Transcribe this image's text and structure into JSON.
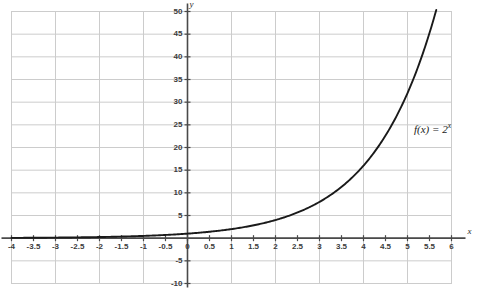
{
  "chart_data": {
    "type": "line",
    "title": "",
    "xlabel": "x",
    "ylabel": "y",
    "annotation": "f(x) = 2^x",
    "annotation_base": "f(x) = 2",
    "annotation_exponent": "x",
    "function": "f(x) = 2^x",
    "grid": true,
    "legend_position": "none",
    "xlim": [
      -4,
      6
    ],
    "ylim": [
      -10,
      50
    ],
    "x_ticks": [
      "-4",
      "-3.5",
      "-3",
      "-2.5",
      "-2",
      "-1.5",
      "-1",
      "-0.5",
      "0",
      "0.5",
      "1",
      "1.5",
      "2",
      "2.5",
      "3",
      "3.5",
      "4",
      "4.5",
      "5",
      "5.5",
      "6"
    ],
    "x_tick_values": [
      -4,
      -3.5,
      -3,
      -2.5,
      -2,
      -1.5,
      -1,
      -0.5,
      0,
      0.5,
      1,
      1.5,
      2,
      2.5,
      3,
      3.5,
      4,
      4.5,
      5,
      5.5,
      6
    ],
    "y_ticks": [
      "-10",
      "-5",
      "5",
      "10",
      "15",
      "20",
      "25",
      "30",
      "35",
      "40",
      "45",
      "50"
    ],
    "y_tick_values": [
      -10,
      -5,
      5,
      10,
      15,
      20,
      25,
      30,
      35,
      40,
      45,
      50
    ],
    "x_gridline_step": 1,
    "y_gridline_step": 5,
    "x": [
      -4,
      -3.5,
      -3,
      -2.5,
      -2,
      -1.5,
      -1,
      -0.5,
      0,
      0.5,
      1,
      1.5,
      2,
      2.5,
      3,
      3.5,
      4,
      4.5,
      5,
      5.5,
      5.65
    ],
    "values": [
      0.063,
      0.088,
      0.125,
      0.177,
      0.25,
      0.354,
      0.5,
      0.707,
      1,
      1.414,
      2,
      2.828,
      4,
      5.657,
      8,
      11.314,
      16,
      22.627,
      32,
      45.255,
      50.2
    ],
    "series": [
      {
        "name": "f(x) = 2^x",
        "values": [
          0.063,
          0.088,
          0.125,
          0.177,
          0.25,
          0.354,
          0.5,
          0.707,
          1,
          1.414,
          2,
          2.828,
          4,
          5.657,
          8,
          11.314,
          16,
          22.627,
          32,
          45.255,
          50.2
        ]
      }
    ]
  },
  "colors": {
    "background": "#ffffff",
    "gridline": "#cccccc",
    "axis": "#4a4a4a",
    "curve": "#1a1a1a",
    "tick_text": "#3b3b3b"
  }
}
